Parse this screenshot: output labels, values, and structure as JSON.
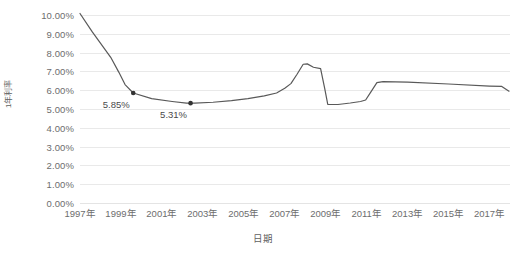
{
  "chart_data": {
    "type": "line",
    "title": "",
    "xlabel": "日期",
    "ylabel": "1年利率",
    "ylim": [
      0,
      0.1
    ],
    "ytick_labels": [
      "10.00%",
      "9.00%",
      "8.00%",
      "7.00%",
      "6.00%",
      "5.00%",
      "4.00%",
      "3.00%",
      "2.00%",
      "1.00%",
      "0.00%"
    ],
    "ytick_values": [
      10.0,
      9.0,
      8.0,
      7.0,
      6.0,
      5.0,
      4.0,
      3.0,
      2.0,
      1.0,
      0.0
    ],
    "xtick_labels": [
      "1997年",
      "1999年",
      "2001年",
      "2003年",
      "2005年",
      "2007年",
      "2009年",
      "2011年",
      "2013年",
      "2015年",
      "2017年"
    ],
    "xtick_values": [
      1997,
      1999,
      2001,
      2003,
      2005,
      2007,
      2009,
      2011,
      2013,
      2015,
      2017
    ],
    "xlim": [
      1997,
      2018
    ],
    "grid": true,
    "legend": false,
    "line_color": "#595959",
    "series": [
      {
        "name": "1年利率",
        "x": [
          1997.0,
          1997.6,
          1998.2,
          1998.5,
          1998.9,
          1999.2,
          1999.6,
          2000.5,
          2001.5,
          2002.2,
          2002.6,
          2003.5,
          2004.4,
          2005.2,
          2006.0,
          2006.6,
          2007.0,
          2007.3,
          2007.6,
          2007.9,
          2008.1,
          2008.4,
          2008.75,
          2008.95,
          2009.1,
          2009.6,
          2010.2,
          2010.7,
          2010.95,
          2011.2,
          2011.5,
          2011.8,
          2013.0,
          2015.0,
          2017.0,
          2017.6,
          2017.95
        ],
        "y": [
          10.08,
          9.1,
          8.2,
          7.75,
          6.95,
          6.3,
          5.85,
          5.55,
          5.4,
          5.31,
          5.31,
          5.36,
          5.45,
          5.55,
          5.7,
          5.85,
          6.1,
          6.35,
          6.85,
          7.38,
          7.4,
          7.22,
          7.15,
          6.1,
          5.25,
          5.24,
          5.32,
          5.4,
          5.48,
          5.9,
          6.4,
          6.46,
          6.43,
          6.33,
          6.22,
          6.2,
          5.95
        ]
      }
    ],
    "annotations": [
      {
        "label": "5.85%",
        "x": 1999.6,
        "y": 5.85,
        "marker": true
      },
      {
        "label": "5.31%",
        "x": 2002.4,
        "y": 5.31,
        "marker": true
      }
    ]
  }
}
